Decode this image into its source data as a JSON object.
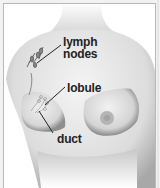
{
  "figure": {
    "type": "anatomical-illustration",
    "labels": {
      "lymph_line1": "lymph",
      "lymph_line2": "nodes",
      "lobule": "lobule",
      "duct": "duct"
    },
    "colors": {
      "background": "#ffffff",
      "border": "#b8b8b8",
      "skin_light": "#f4f4f4",
      "skin_shadow": "#9a9a9a",
      "label_text": "#222222",
      "areola": "#b5b5b5"
    }
  }
}
